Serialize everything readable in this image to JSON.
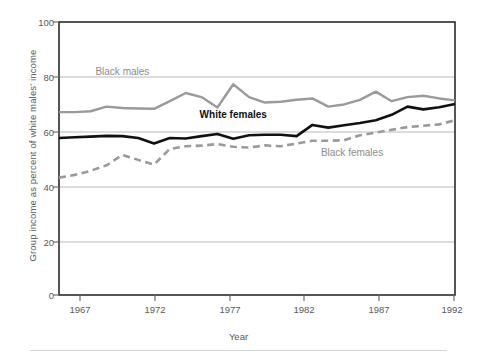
{
  "chart_data": {
    "type": "line",
    "title": "",
    "subtitle": "",
    "xlabel": "Year",
    "ylabel": "Group income as percent of white males' income",
    "xlim": [
      1967,
      1992
    ],
    "ylim": [
      0,
      100
    ],
    "xticks": [
      "1967",
      "1972",
      "1977",
      "1982",
      "1987",
      "1992"
    ],
    "yticks": [
      "0",
      "20",
      "40",
      "60",
      "80",
      "100"
    ],
    "grid": "horizontal",
    "legend_position": "inline-annotations",
    "x": [
      1967,
      1968,
      1969,
      1970,
      1971,
      1972,
      1973,
      1974,
      1975,
      1976,
      1977,
      1978,
      1979,
      1980,
      1981,
      1982,
      1983,
      1984,
      1985,
      1986,
      1987,
      1988,
      1989,
      1990,
      1991,
      1992
    ],
    "series": [
      {
        "name": "Black males",
        "color": "#9a9a9a",
        "style": "solid",
        "label_text": "Black males",
        "values": [
          67.0,
          67.0,
          67.3,
          69.0,
          68.5,
          68.3,
          68.2,
          71.0,
          74.0,
          72.5,
          68.7,
          77.2,
          72.5,
          70.5,
          70.8,
          71.5,
          72.0,
          69.0,
          69.8,
          71.5,
          74.5,
          71.0,
          72.5,
          73.0,
          72.0,
          71.3
        ]
      },
      {
        "name": "White females",
        "color": "#111111",
        "style": "solid",
        "label_text": "White females",
        "values": [
          57.5,
          57.8,
          58.0,
          58.3,
          58.2,
          57.5,
          55.5,
          57.5,
          57.3,
          58.2,
          59.0,
          57.2,
          58.5,
          58.7,
          58.7,
          58.2,
          62.3,
          61.3,
          62.2,
          63.0,
          64.0,
          66.0,
          69.0,
          68.0,
          68.8,
          70.0
        ]
      },
      {
        "name": "Black females",
        "color": "#9a9a9a",
        "style": "dashed",
        "label_text": "Black females",
        "values": [
          43.0,
          44.0,
          45.5,
          47.5,
          51.3,
          49.5,
          47.8,
          53.5,
          54.5,
          54.7,
          55.3,
          54.3,
          54.0,
          54.8,
          54.5,
          55.5,
          56.5,
          56.5,
          56.7,
          58.5,
          59.5,
          60.5,
          61.5,
          62.0,
          62.5,
          64.0
        ]
      }
    ],
    "annotations": [
      {
        "text": "Black males",
        "x": 1971.0,
        "y": 81.5
      },
      {
        "text": "White females",
        "x": 1978.0,
        "y": 65.5
      },
      {
        "text": "Black females",
        "x": 1985.5,
        "y": 51.5
      }
    ]
  }
}
